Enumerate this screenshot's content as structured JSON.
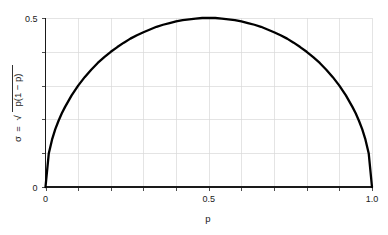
{
  "chart_data": {
    "type": "line",
    "title": "",
    "subtitle": "",
    "xlabel": "p",
    "ylabel": "σ = √(p(1 − p))",
    "ylabel_parts": {
      "sigma": "σ",
      "equals": "=",
      "radical": "√",
      "radicand": "p(1 − p)"
    },
    "xlim": [
      0,
      1
    ],
    "ylim": [
      0,
      0.5
    ],
    "grid": true,
    "legend": false,
    "legend_position": "none",
    "x_tick_labels": [
      "0",
      "0.5",
      "1.0"
    ],
    "x_tick_values": [
      0,
      0.5,
      1.0
    ],
    "x_minor_ticks": [
      0.1,
      0.2,
      0.3,
      0.4,
      0.6,
      0.7,
      0.8,
      0.9
    ],
    "y_tick_labels": [
      "0",
      "0.5"
    ],
    "y_tick_values": [
      0,
      0.5
    ],
    "y_minor_ticks": [
      0.1,
      0.2,
      0.3,
      0.4
    ],
    "series": [
      {
        "name": "σ = √(p(1 − p))",
        "color": "#000000",
        "x": [
          0.0,
          0.01,
          0.02,
          0.03,
          0.04,
          0.05,
          0.06,
          0.08,
          0.1,
          0.12,
          0.14,
          0.16,
          0.18,
          0.2,
          0.22,
          0.24,
          0.26,
          0.28,
          0.3,
          0.32,
          0.34,
          0.36,
          0.38,
          0.4,
          0.42,
          0.44,
          0.46,
          0.48,
          0.5,
          0.52,
          0.54,
          0.56,
          0.58,
          0.6,
          0.62,
          0.64,
          0.66,
          0.68,
          0.7,
          0.72,
          0.74,
          0.76,
          0.78,
          0.8,
          0.82,
          0.84,
          0.86,
          0.88,
          0.9,
          0.92,
          0.94,
          0.95,
          0.96,
          0.97,
          0.98,
          0.99,
          1.0
        ],
        "values": [
          0.0,
          0.099,
          0.14,
          0.171,
          0.196,
          0.218,
          0.237,
          0.271,
          0.3,
          0.325,
          0.347,
          0.367,
          0.384,
          0.4,
          0.414,
          0.427,
          0.439,
          0.449,
          0.458,
          0.466,
          0.474,
          0.48,
          0.485,
          0.49,
          0.494,
          0.496,
          0.498,
          0.5,
          0.5,
          0.5,
          0.498,
          0.496,
          0.494,
          0.49,
          0.485,
          0.48,
          0.474,
          0.466,
          0.458,
          0.449,
          0.439,
          0.427,
          0.414,
          0.4,
          0.384,
          0.367,
          0.347,
          0.325,
          0.3,
          0.271,
          0.237,
          0.218,
          0.196,
          0.171,
          0.14,
          0.099,
          0.0
        ]
      }
    ],
    "annotations": [],
    "peak": {
      "x": 0.5,
      "y": 0.5
    }
  }
}
